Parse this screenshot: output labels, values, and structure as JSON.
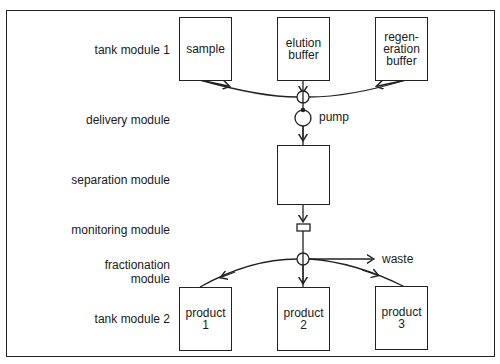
{
  "diagram": {
    "row_labels": {
      "tank1": "tank module 1",
      "delivery": "delivery module",
      "separation": "separation module",
      "monitoring": "monitoring module",
      "fractionation": "fractionation\nmodule",
      "tank2": "tank module 2"
    },
    "tanks_in": [
      {
        "label": "sample"
      },
      {
        "label": "elution\nbuffer"
      },
      {
        "label": "regen-\neration\nbuffer"
      }
    ],
    "tanks_out": [
      {
        "label": "product\n1"
      },
      {
        "label": "product\n2"
      },
      {
        "label": "product\n3"
      }
    ],
    "pump_label": "pump",
    "waste_label": "waste",
    "separation_label": ""
  }
}
